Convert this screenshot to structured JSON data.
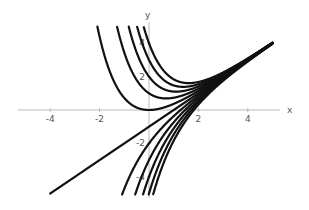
{
  "chart_data": {
    "type": "line",
    "title": "",
    "xlabel": "x",
    "ylabel": "y",
    "xlim": [
      -5.2,
      5
    ],
    "ylim": [
      -5.2,
      5
    ],
    "grid": false,
    "legend": null,
    "x_ticks": [
      -4,
      -2,
      2,
      4
    ],
    "y_ticks": [
      4,
      2,
      -2,
      -4
    ],
    "series": [
      {
        "name": "C=5",
        "C": 5
      },
      {
        "name": "C=4",
        "C": 4
      },
      {
        "name": "C=3",
        "C": 3
      },
      {
        "name": "C=2",
        "C": 2
      },
      {
        "name": "C=1",
        "C": 1
      },
      {
        "name": "C=0",
        "C": 0
      },
      {
        "name": "C=-1",
        "C": -1
      },
      {
        "name": "C=-2",
        "C": -2
      },
      {
        "name": "C=-3",
        "C": -3
      },
      {
        "name": "C=-4",
        "C": -4
      },
      {
        "name": "C=-5",
        "C": -5
      }
    ]
  },
  "axes": {
    "x_label": "x",
    "y_label": "y",
    "x_tick_labels": [
      "-4",
      "-2",
      "2",
      "4"
    ],
    "y_tick_labels": [
      "4",
      "2",
      "-2",
      "-4"
    ]
  }
}
